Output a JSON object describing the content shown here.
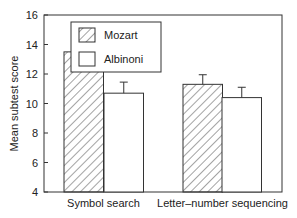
{
  "chart_data": {
    "type": "bar",
    "title": "",
    "xlabel": "",
    "ylabel": "Mean subtest score",
    "ylim": [
      4,
      16
    ],
    "yticks": [
      4,
      6,
      8,
      10,
      12,
      14,
      16
    ],
    "grid": false,
    "legend_position": "upper-left-inside",
    "categories": [
      "Symbol search",
      "Letter–number sequencing"
    ],
    "series": [
      {
        "name": "Mozart",
        "pattern": "diagonal-hatch",
        "values": [
          13.5,
          11.3
        ],
        "error_upper": [
          0.7,
          0.65
        ]
      },
      {
        "name": "Albinoni",
        "pattern": "white",
        "values": [
          10.7,
          10.4
        ],
        "error_upper": [
          0.75,
          0.7
        ]
      }
    ]
  },
  "legend": {
    "items": [
      "Mozart",
      "Albinoni"
    ]
  },
  "axis": {
    "ylabel": "Mean subtest score",
    "ticks": [
      "4",
      "6",
      "8",
      "10",
      "12",
      "14",
      "16"
    ]
  },
  "categories": [
    "Symbol search",
    "Letter–number sequencing"
  ]
}
